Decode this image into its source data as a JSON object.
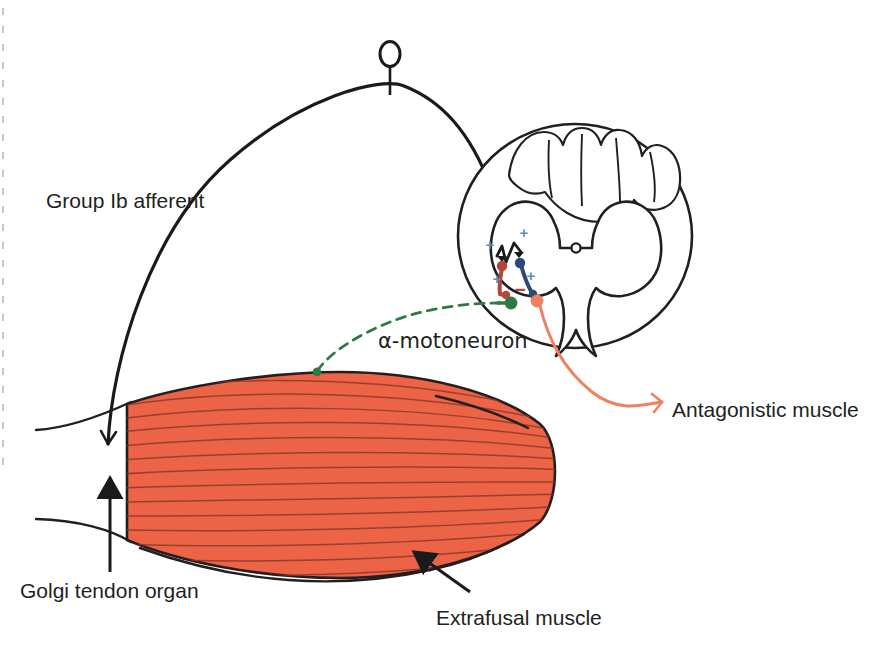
{
  "figure": {
    "width": 895,
    "height": 655,
    "background": "#ffffff"
  },
  "labels": {
    "group_ib_afferent": "Group Ib afferent",
    "alpha_motoneuron": "α-motoneuron",
    "antagonistic_muscle": "Antagonistic muscle",
    "golgi_tendon_organ": "Golgi tendon organ",
    "extrafusal_muscle": "Extrafusal muscle"
  },
  "signs": {
    "plus": "+",
    "minus": "−",
    "plus_count": 4,
    "minus_count": 1
  },
  "colors": {
    "outline": "#231f20",
    "muscle_fill": "#ec6346",
    "muscle_stroke": "#231f20",
    "muscle_fiber_line": "#8a3a2a",
    "afferent_black": "#1a1a1a",
    "interneuron_red": "#b4453a",
    "interneuron_blue": "#2a4a7a",
    "motoneuron_green": "#2f7a44",
    "antagonist_orange": "#ef8060",
    "sign_plus": "#5b8fc9",
    "sign_minus": "#b4453a",
    "dashed_green": "#2f7a44"
  },
  "structures": [
    {
      "name": "sensory-receptor-soma",
      "description": "Small oval soma on a stalk at apex of the Ib afferent arc"
    },
    {
      "name": "group-ib-afferent-fiber",
      "description": "Black arc from Golgi tendon organ to dorsal horn"
    },
    {
      "name": "spinal-cord-cross-section",
      "description": "Oval white matter with butterfly gray matter"
    },
    {
      "name": "dorsal-columns",
      "description": "Fasciculus gracilis/cuneatus lobes at the top"
    },
    {
      "name": "central-canal",
      "description": "Small circle at center of gray commissure"
    },
    {
      "name": "inhibitory-interneuron-red",
      "description": "Red interneuron receiving Ib input, inhibits motoneuron"
    },
    {
      "name": "excitatory-interneuron-blue",
      "description": "Blue interneuron receiving Ib input, excites antagonist motoneuron"
    },
    {
      "name": "alpha-motoneuron-green",
      "description": "Green alpha-motoneuron soma to extrafusal muscle"
    },
    {
      "name": "antagonist-motoneuron-orange",
      "description": "Orange motoneuron soma projecting to antagonistic muscle"
    },
    {
      "name": "extrafusal-muscle-belly",
      "description": "Orange striated fusiform muscle belly"
    },
    {
      "name": "tendon-upper",
      "description": "Upper tendon line left of the muscle belly"
    },
    {
      "name": "tendon-lower",
      "description": "Lower tendon line left of the muscle belly"
    },
    {
      "name": "golgi-tendon-organ-arrow",
      "description": "Upward arrow pointing at the tendon"
    },
    {
      "name": "extrafusal-muscle-arrow",
      "description": "Arrow pointing up-left to muscle belly"
    }
  ]
}
